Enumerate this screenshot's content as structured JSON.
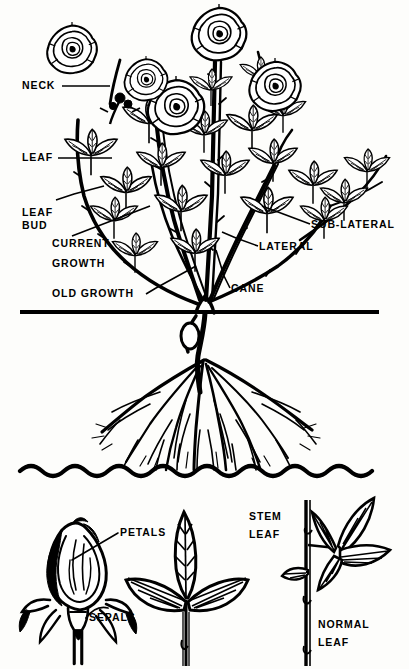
{
  "diagram": {
    "style": "black-and-white line engraving",
    "background_color": "#fdfdfb",
    "ink_color": "#000000"
  },
  "labels": {
    "neck": "NECK",
    "leaf": "LEAF",
    "leaf_bud_line1": "LEAF",
    "leaf_bud_line2": "BUD",
    "current_growth_line1": "CURRENT",
    "current_growth_line2": "GROWTH",
    "old_growth": "OLD GROWTH",
    "sub_lateral": "SUB-LATERAL",
    "lateral": "LATERAL",
    "cane": "CANE",
    "petals": "PETALS",
    "sepals": "SEPALS",
    "stem_leaf_line1": "STEM",
    "stem_leaf_line2": "LEAF",
    "normal_leaf_line1": "NORMAL",
    "normal_leaf_line2": "LEAF"
  },
  "sections": {
    "above_ground": "rose bush with blooms, canes, laterals and leaves",
    "soil": "stippled soil cross-section with root system",
    "details": "rosebud, stem leaf and normal leaf specimens"
  },
  "soil": {
    "ground_line_y": 313,
    "bottom_wave_y": 474,
    "left_x": 20,
    "right_x": 379
  }
}
